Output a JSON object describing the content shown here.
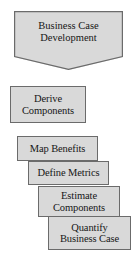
{
  "diagram": {
    "type": "process-flow",
    "background_color": "#ffffff",
    "shape_fill_color": "#d9d9d9",
    "shape_border_color": "#6b6b6b",
    "text_color": "#161616",
    "header": {
      "shape": "pentagon-down-arrow",
      "label": "Business Case\nDevelopment"
    },
    "steps": [
      {
        "shape": "rectangle",
        "label": "Derive\nComponents"
      },
      {
        "shape": "rectangle",
        "label": "Map Benefits"
      },
      {
        "shape": "rectangle",
        "label": "Define Metrics"
      },
      {
        "shape": "rectangle",
        "label": "Estimate\nComponents"
      },
      {
        "shape": "rectangle",
        "label": "Quantify\nBusiness Case"
      }
    ]
  }
}
